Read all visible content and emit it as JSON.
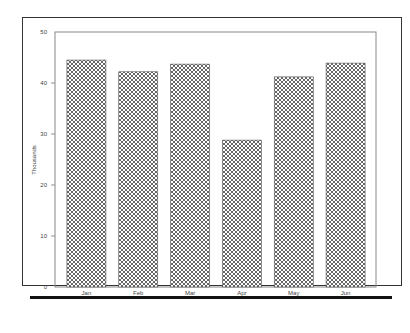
{
  "chart_data": {
    "type": "bar",
    "title": "",
    "xlabel": "",
    "ylabel": "Thousands",
    "categories": [
      "Jan",
      "Feb",
      "Mar",
      "Apr",
      "May",
      "Jun"
    ],
    "values": [
      44.5,
      42.2,
      43.7,
      28.8,
      41.2,
      43.9
    ],
    "ylim": [
      0,
      50
    ],
    "yticks": [
      0,
      10,
      20,
      30,
      40,
      50
    ],
    "grid": false,
    "legend": "none",
    "bar_fill": "crosshatch",
    "colors": {
      "bar_pattern": "#555555",
      "bar_bg": "#ffffff",
      "axis": "#777777",
      "frame": "#333333",
      "rule": "#111111"
    }
  }
}
